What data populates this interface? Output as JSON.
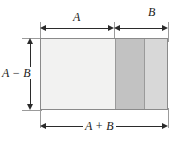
{
  "figure": {
    "labels": {
      "top_left_dimension": "A",
      "top_right_dimension": "B",
      "left_dimension": "A − B",
      "bottom_dimension": "A + B"
    },
    "colors": {
      "region_light": "#f2f2f1",
      "region_medium": "#c2c2c2",
      "region_light_gray": "#d8d8d8",
      "outline": "#8a8a8a",
      "dimension_line": "#2b2b2b",
      "extension_line": "#9b9b9b",
      "background": "#ffffff"
    },
    "regions": [
      {
        "name": "left-light-region",
        "fill": "#f2f2f1"
      },
      {
        "name": "middle-dark-region",
        "fill": "#c2c2c2"
      },
      {
        "name": "right-gray-region",
        "fill": "#d8d8d8"
      }
    ]
  }
}
